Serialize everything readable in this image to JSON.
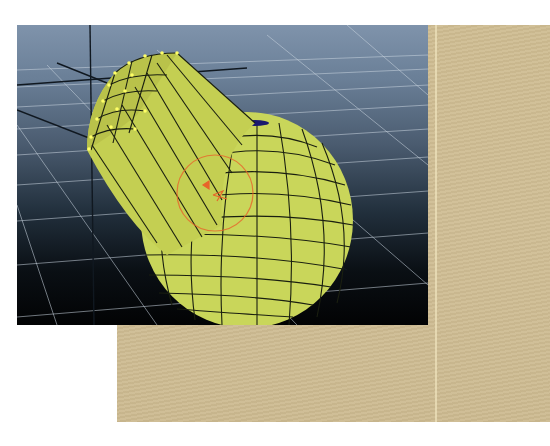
{
  "page": {
    "header_text_visible": false
  },
  "viewport": {
    "type": "3d-perspective-view",
    "object": "polygon-sphere-with-extruded-cylinder",
    "mesh_color": "#c9d65a",
    "wire_color": "#1a1f10",
    "vertex_highlight_color": "#ffff66",
    "manipulator": "rotate-manipulator",
    "manipulator_color": "#e8642a",
    "grid_color": "#d8e0ea",
    "background_top": "#7f93ab",
    "background_bottom": "#020304"
  },
  "panel": {
    "color": "#cfbd92"
  }
}
